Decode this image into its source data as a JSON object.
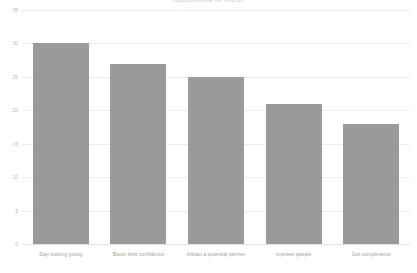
{
  "chart_data": {
    "type": "bar",
    "title": "(according to men)",
    "subtitle": "",
    "xlabel": "",
    "ylabel": "",
    "categories": [
      "Stay looking young",
      "Boost their confidence",
      "Attract a potential partner",
      "Impress people",
      "Get compliments"
    ],
    "values": [
      30,
      27,
      25,
      21,
      18
    ],
    "ylim": [
      0,
      35
    ],
    "ytick_values": [
      0,
      5,
      10,
      15,
      20,
      25,
      30,
      35
    ],
    "ytick_labels": [
      "0",
      "5",
      "10",
      "15",
      "20",
      "25",
      "30",
      "35"
    ],
    "grid": true,
    "legend": "none",
    "bar_color": "#9a9a9a",
    "grid_color": "#ededed",
    "axis_label_color": "#b8b8b8",
    "background_color": "#ffffff"
  }
}
